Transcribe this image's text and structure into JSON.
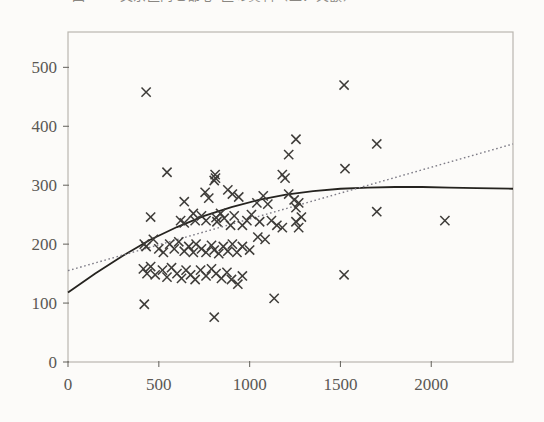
{
  "figure": {
    "caption_partial": "図5-3-3  文京区内と都心5区の賃料（上：実額）",
    "background_color": "#fcfbf9",
    "frame_color": "#b9b6b0",
    "marker_color": "#3d3b38",
    "solid_curve_color": "#25231f",
    "dotted_line_color": "#7d7b86"
  },
  "chart_data": {
    "type": "scatter",
    "title": "",
    "xlabel": "",
    "ylabel": "",
    "xlim": [
      0,
      2450
    ],
    "ylim": [
      0,
      560
    ],
    "xticks": [
      0,
      500,
      1000,
      1500,
      2000
    ],
    "yticks": [
      0,
      100,
      200,
      300,
      400,
      500
    ],
    "xticklabels": [
      "0",
      "500",
      "1000",
      "1500",
      "2000"
    ],
    "yticklabels": [
      "0",
      "100",
      "200",
      "300",
      "400",
      "500"
    ],
    "grid": false,
    "legend": "none",
    "marker": "x",
    "points": [
      [
        430,
        458
      ],
      [
        1520,
        470
      ],
      [
        1255,
        378
      ],
      [
        1700,
        370
      ],
      [
        1215,
        352
      ],
      [
        1525,
        328
      ],
      [
        545,
        322
      ],
      [
        810,
        318
      ],
      [
        812,
        312
      ],
      [
        805,
        308
      ],
      [
        1180,
        318
      ],
      [
        1195,
        312
      ],
      [
        1700,
        255
      ],
      [
        640,
        272
      ],
      [
        880,
        292
      ],
      [
        905,
        285
      ],
      [
        690,
        252
      ],
      [
        755,
        288
      ],
      [
        775,
        278
      ],
      [
        940,
        280
      ],
      [
        1040,
        270
      ],
      [
        1075,
        282
      ],
      [
        1100,
        268
      ],
      [
        1215,
        285
      ],
      [
        1245,
        275
      ],
      [
        1255,
        262
      ],
      [
        1270,
        270
      ],
      [
        455,
        246
      ],
      [
        620,
        240
      ],
      [
        640,
        236
      ],
      [
        700,
        240
      ],
      [
        735,
        248
      ],
      [
        760,
        240
      ],
      [
        815,
        245
      ],
      [
        820,
        238
      ],
      [
        840,
        252
      ],
      [
        860,
        244
      ],
      [
        895,
        232
      ],
      [
        915,
        248
      ],
      [
        960,
        232
      ],
      [
        985,
        240
      ],
      [
        1010,
        250
      ],
      [
        1055,
        238
      ],
      [
        1120,
        240
      ],
      [
        1150,
        232
      ],
      [
        1180,
        228
      ],
      [
        1255,
        238
      ],
      [
        1270,
        228
      ],
      [
        1285,
        246
      ],
      [
        2075,
        240
      ],
      [
        420,
        200
      ],
      [
        430,
        196
      ],
      [
        470,
        208
      ],
      [
        500,
        192
      ],
      [
        525,
        186
      ],
      [
        560,
        200
      ],
      [
        585,
        192
      ],
      [
        610,
        204
      ],
      [
        640,
        188
      ],
      [
        665,
        196
      ],
      [
        690,
        186
      ],
      [
        705,
        200
      ],
      [
        735,
        192
      ],
      [
        760,
        186
      ],
      [
        790,
        198
      ],
      [
        805,
        190
      ],
      [
        830,
        184
      ],
      [
        855,
        196
      ],
      [
        880,
        188
      ],
      [
        905,
        200
      ],
      [
        930,
        186
      ],
      [
        960,
        196
      ],
      [
        1000,
        190
      ],
      [
        1045,
        212
      ],
      [
        1085,
        208
      ],
      [
        415,
        158
      ],
      [
        435,
        150
      ],
      [
        455,
        162
      ],
      [
        480,
        148
      ],
      [
        520,
        156
      ],
      [
        545,
        144
      ],
      [
        570,
        160
      ],
      [
        600,
        150
      ],
      [
        625,
        142
      ],
      [
        650,
        156
      ],
      [
        675,
        148
      ],
      [
        700,
        140
      ],
      [
        730,
        156
      ],
      [
        760,
        146
      ],
      [
        790,
        158
      ],
      [
        815,
        150
      ],
      [
        845,
        142
      ],
      [
        875,
        152
      ],
      [
        900,
        140
      ],
      [
        935,
        132
      ],
      [
        960,
        146
      ],
      [
        1135,
        108
      ],
      [
        1520,
        148
      ],
      [
        420,
        98
      ],
      [
        805,
        76
      ]
    ],
    "fit_curves": [
      {
        "name": "quadratic-fit",
        "style": "solid",
        "color": "#25231f",
        "points": [
          [
            0,
            118
          ],
          [
            150,
            150
          ],
          [
            300,
            180
          ],
          [
            450,
            207
          ],
          [
            600,
            229
          ],
          [
            750,
            248
          ],
          [
            900,
            263
          ],
          [
            1050,
            275
          ],
          [
            1200,
            284
          ],
          [
            1350,
            290
          ],
          [
            1500,
            294
          ],
          [
            1650,
            296
          ],
          [
            1800,
            297
          ],
          [
            1950,
            297
          ],
          [
            2100,
            296
          ],
          [
            2250,
            295
          ],
          [
            2450,
            294
          ]
        ]
      },
      {
        "name": "linear-fit",
        "style": "dotted",
        "color": "#7d7b86",
        "points": [
          [
            0,
            155
          ],
          [
            2450,
            370
          ]
        ]
      }
    ]
  }
}
